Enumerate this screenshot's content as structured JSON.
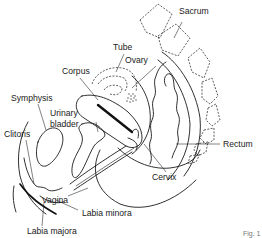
{
  "diagram": {
    "type": "anatomical sagittal section",
    "labels": {
      "sacrum": "Sacrum",
      "tube": "Tube",
      "ovary": "Ovary",
      "corpus": "Corpus",
      "symphysis": "Symphysis",
      "urinary_bladder_line1": "Urinary",
      "urinary_bladder_line2": "bladder",
      "clitoris": "Clitoris",
      "rectum": "Rectum",
      "cervix": "Cervix",
      "vagina": "Vagina",
      "labia_minora": "Labia minora",
      "labia_majora": "Labia majora",
      "figure_caption_partial": "Fig. 1"
    }
  }
}
